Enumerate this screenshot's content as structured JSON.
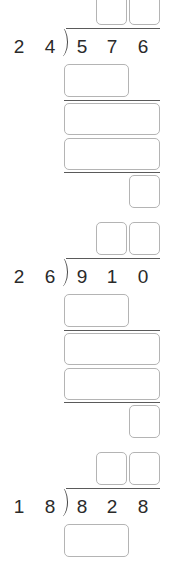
{
  "problems": [
    {
      "divisor": [
        "2",
        "4"
      ],
      "dividend": [
        "5",
        "7",
        "6"
      ],
      "offset_top": -8
    },
    {
      "divisor": [
        "2",
        "6"
      ],
      "dividend": [
        "9",
        "1",
        "0"
      ],
      "offset_top": 222
    },
    {
      "divisor": [
        "1",
        "8"
      ],
      "dividend": [
        "8",
        "2",
        "8"
      ],
      "offset_top": 452
    }
  ],
  "colors": {
    "box_border": "#b4b4b4",
    "rule_line": "#5a5a5a",
    "digit_text": "#2a2a2a",
    "background": "#ffffff"
  }
}
